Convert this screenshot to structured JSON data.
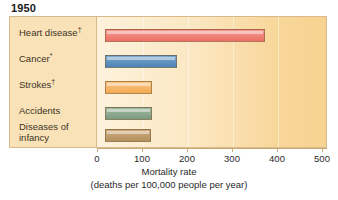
{
  "chart_data": {
    "type": "bar",
    "orientation": "horizontal",
    "title": "1950",
    "categories": [
      "Heart disease†",
      "Cancer*",
      "Strokes†",
      "Accidents",
      "Diseases of infancy"
    ],
    "values": [
      355,
      160,
      105,
      105,
      103
    ],
    "xlabel": "Mortality rate",
    "xlabel_sub": "(deaths per 100,000 people per year)",
    "ylabel": "",
    "xlim": [
      0,
      500
    ],
    "xticks": [
      0,
      100,
      200,
      300,
      400,
      500
    ],
    "xticklabels": [
      "0",
      "100",
      "200",
      "300",
      "400",
      "500"
    ],
    "grid": false,
    "legend": "none",
    "bar_colors": [
      "#ef7d74",
      "#5b8fbf",
      "#f5b567",
      "#8aa68c",
      "#c09a69"
    ]
  },
  "title": {
    "text": "1950"
  },
  "labels": [
    {
      "text": "Heart disease",
      "sup": "†",
      "line2": ""
    },
    {
      "text": "Cancer",
      "sup": "*",
      "line2": ""
    },
    {
      "text": "Strokes",
      "sup": "†",
      "line2": ""
    },
    {
      "text": "Accidents",
      "sup": "",
      "line2": ""
    },
    {
      "text": "Diseases of",
      "sup": "",
      "line2": "infancy"
    }
  ],
  "axis": {
    "title": "Mortality rate",
    "subtitle": "(deaths per 100,000 people per year)",
    "ticks": [
      "0",
      "100",
      "200",
      "300",
      "400",
      "500"
    ]
  },
  "colors": {
    "frame_border": "#d8b98a",
    "panel_bg": "#fae2b8",
    "plot_bg": "#fbe7c2",
    "bar_heart": "#ef7d74",
    "bar_cancer": "#5b8fbf",
    "bar_strokes": "#f5b567",
    "bar_accidents": "#8aa68c",
    "bar_infancy": "#c09a69"
  }
}
